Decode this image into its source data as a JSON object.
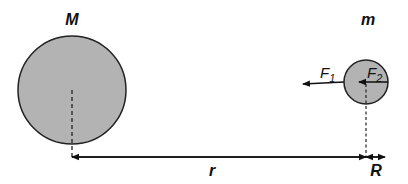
{
  "labels": {
    "big_mass": "M",
    "small_mass": "m",
    "distance": "r",
    "small_radius": "R",
    "force1_main": "F",
    "force1_sub": "1",
    "force2_main": "F",
    "force2_sub": "2"
  },
  "colors": {
    "circle_fill": "#b3b3b3",
    "stroke": "#222222",
    "background": "#ffffff"
  }
}
